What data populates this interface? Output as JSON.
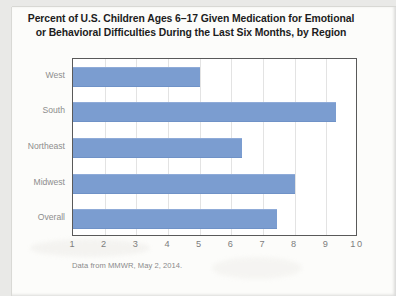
{
  "document": {
    "source_note": "Data from MMWR, May 2, 2014."
  },
  "chart_data": {
    "type": "bar",
    "orientation": "horizontal",
    "title": "Percent of U.S. Children Ages 6–17 Given Medication for Emotional or Behavioral Difficulties During the Last Six Months, by Region",
    "title_line1": "Percent of U.S. Children Ages 6–17 Given Medication for Emotional",
    "title_line2": "or Behavioral Difficulties During the Last Six Months, by Region",
    "categories": [
      "West",
      "South",
      "Northeast",
      "Midwest",
      "Overall"
    ],
    "values": [
      5.0,
      9.3,
      6.35,
      8.0,
      7.45
    ],
    "xlabel": "",
    "ylabel": "",
    "xlim": [
      1,
      10
    ],
    "xticks": [
      "1",
      "2",
      "3",
      "4",
      "5",
      "6",
      "7",
      "8",
      "9",
      "10"
    ],
    "grid": "vertical",
    "legend": "none",
    "bar_color": "#7b9dd0",
    "frame_color": "#595959",
    "gridline_color": "#e3e3e3",
    "label_color": "#8d8d8d"
  }
}
